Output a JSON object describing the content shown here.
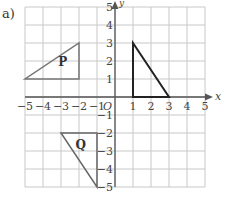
{
  "part_label": "a)",
  "axes": {
    "x_label": "x",
    "y_label": "y",
    "origin_label": "O",
    "x_range": [
      -5,
      5
    ],
    "y_range": [
      -5,
      5
    ],
    "x_ticks": [
      "-5",
      "-4",
      "-3",
      "-2",
      "-1",
      "1",
      "2",
      "3",
      "4",
      "5"
    ],
    "y_ticks": [
      "5",
      "4",
      "3",
      "2",
      "1",
      "-1",
      "-2",
      "-3",
      "-4",
      "-5"
    ]
  },
  "shapes": [
    {
      "label": "P",
      "vertices": [
        [
          -5,
          1
        ],
        [
          -2,
          1
        ],
        [
          -2,
          3
        ]
      ],
      "label_pos": [
        -2.9,
        1.7
      ]
    },
    {
      "label": "Q",
      "vertices": [
        [
          -3,
          -2
        ],
        [
          -1,
          -2
        ],
        [
          -1,
          -5
        ]
      ],
      "label_pos": [
        -1.9,
        -2.9
      ]
    },
    {
      "label": "",
      "vertices": [
        [
          1,
          0
        ],
        [
          1,
          3
        ],
        [
          3,
          0
        ]
      ]
    }
  ],
  "colors": {
    "grid": "#c8c8c8",
    "axes": "#555555",
    "shape_p": "#777777",
    "shape_q": "#666666",
    "shape_main": "#222222",
    "text": "#444444"
  }
}
